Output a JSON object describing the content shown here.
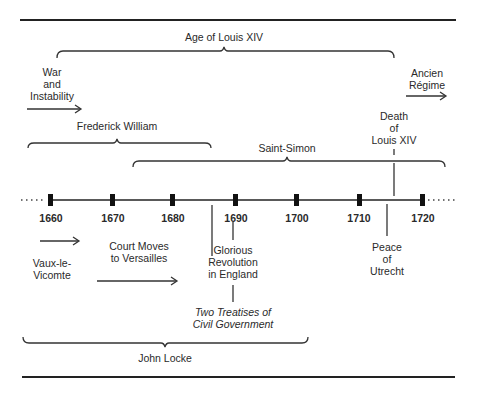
{
  "timeline": {
    "years": [
      "1660",
      "1670",
      "1680",
      "1690",
      "1700",
      "1710",
      "1720"
    ],
    "continues_left": true,
    "continues_right": true
  },
  "spans_above": [
    {
      "label": "Age of Louis XIV",
      "start_year": 1661,
      "end_year": 1715
    },
    {
      "label": "Frederick William",
      "start_year": 1640,
      "end_year": 1688
    },
    {
      "label": "Saint-Simon",
      "start_year": 1675,
      "end_year": 1755
    }
  ],
  "spans_below": [
    {
      "label": "John Locke",
      "start_year": 1632,
      "end_year": 1704
    }
  ],
  "arrows": {
    "war_and_instability": {
      "lines": [
        "War",
        "and",
        "Instability"
      ]
    },
    "ancien_regime": {
      "lines": [
        "Ancien",
        "Régime"
      ]
    },
    "vaux_le_vicomte": {
      "lines": [
        "Vaux-le-",
        "Vicomte"
      ]
    },
    "court_moves": {
      "lines": [
        "Court Moves",
        "to Versailles"
      ]
    }
  },
  "events": {
    "death_of_louis_xiv": {
      "lines": [
        "Death",
        "of",
        "Louis XIV"
      ],
      "year": 1715
    },
    "peace_of_utrecht": {
      "lines": [
        "Peace",
        "of",
        "Utrecht"
      ],
      "year": 1713
    },
    "glorious_revolution": {
      "lines": [
        "Glorious",
        "Revolution",
        "in England"
      ],
      "year": 1688
    },
    "two_treatises": {
      "lines": [
        "Two Treatises of",
        "Civil Government"
      ],
      "year": 1690
    }
  },
  "colors": {
    "ink": "#2a2a2a",
    "background": "#ffffff"
  }
}
